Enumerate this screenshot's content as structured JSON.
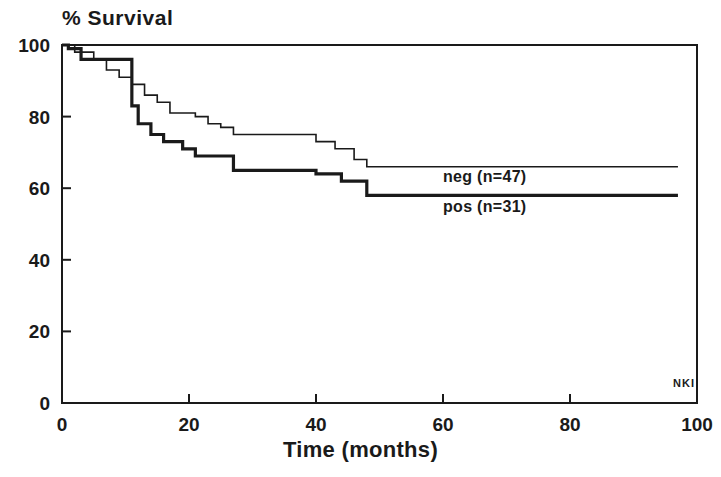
{
  "chart_data": {
    "type": "line",
    "subtype": "kaplan-meier-step",
    "title": "% Survival",
    "xlabel": "Time (months)",
    "ylabel": "% Survival",
    "xlim": [
      0,
      100
    ],
    "ylim": [
      0,
      100
    ],
    "xticks": [
      0,
      20,
      40,
      60,
      80,
      100
    ],
    "yticks": [
      0,
      20,
      40,
      60,
      80,
      100
    ],
    "grid": false,
    "frame": "box",
    "legend_position": "inline-right",
    "annotations": [
      "NKI"
    ],
    "series": [
      {
        "name": "neg (n=47)",
        "label": "neg (n=47)",
        "group": "neg",
        "n": 47,
        "style": "thin",
        "color": "#1a1a1a",
        "line_width": 1.6,
        "final_survival": 66,
        "steps": [
          [
            0,
            100
          ],
          [
            2,
            100
          ],
          [
            2,
            98
          ],
          [
            5,
            98
          ],
          [
            5,
            96
          ],
          [
            7,
            96
          ],
          [
            7,
            93
          ],
          [
            9,
            93
          ],
          [
            9,
            91
          ],
          [
            11,
            91
          ],
          [
            11,
            89
          ],
          [
            13,
            89
          ],
          [
            13,
            86
          ],
          [
            15,
            86
          ],
          [
            15,
            84
          ],
          [
            17,
            84
          ],
          [
            17,
            81
          ],
          [
            21,
            81
          ],
          [
            21,
            80
          ],
          [
            23,
            80
          ],
          [
            23,
            78
          ],
          [
            25,
            78
          ],
          [
            25,
            77
          ],
          [
            27,
            77
          ],
          [
            27,
            75
          ],
          [
            40,
            75
          ],
          [
            40,
            73
          ],
          [
            43,
            73
          ],
          [
            43,
            71
          ],
          [
            46,
            71
          ],
          [
            46,
            68
          ],
          [
            48,
            68
          ],
          [
            48,
            66
          ],
          [
            97,
            66
          ]
        ]
      },
      {
        "name": "pos (n=31)",
        "label": "pos (n=31)",
        "group": "pos",
        "n": 31,
        "style": "bold",
        "color": "#1a1a1a",
        "line_width": 3.2,
        "final_survival": 58,
        "steps": [
          [
            0,
            100
          ],
          [
            1,
            100
          ],
          [
            1,
            99
          ],
          [
            3,
            99
          ],
          [
            3,
            96
          ],
          [
            11,
            96
          ],
          [
            11,
            83
          ],
          [
            12,
            83
          ],
          [
            12,
            78
          ],
          [
            14,
            78
          ],
          [
            14,
            75
          ],
          [
            16,
            75
          ],
          [
            16,
            73
          ],
          [
            19,
            73
          ],
          [
            19,
            71
          ],
          [
            21,
            71
          ],
          [
            21,
            69
          ],
          [
            27,
            69
          ],
          [
            27,
            65
          ],
          [
            40,
            65
          ],
          [
            40,
            64
          ],
          [
            44,
            64
          ],
          [
            44,
            62
          ],
          [
            48,
            62
          ],
          [
            48,
            58
          ],
          [
            97,
            58
          ]
        ]
      }
    ]
  },
  "axis": {
    "y_tick_labels": [
      "100",
      "80",
      "60",
      "40",
      "20",
      "0"
    ],
    "x_tick_labels": [
      "0",
      "20",
      "40",
      "60",
      "80",
      "100"
    ],
    "x_title": "Time (months)"
  },
  "legend": {
    "neg_label": "neg (n=47)",
    "pos_label": "pos (n=31)"
  },
  "watermark": {
    "text": "NKI"
  },
  "colors": {
    "ink": "#1a1a1a",
    "background": "#ffffff"
  }
}
